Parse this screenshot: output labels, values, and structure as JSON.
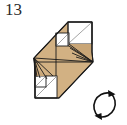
{
  "page": {
    "background": "#ffffff",
    "width": 127,
    "height": 125
  },
  "step": {
    "number": "13",
    "label_color": "#2b2b2b"
  },
  "colors": {
    "paper_front": "#d2b183",
    "paper_front_shade": "#c9a677",
    "paper_back": "#ffffff",
    "crease_line": "#1a1a1a",
    "soft_crease_line": "#8e8e8e",
    "outline": "#1a1a1a",
    "symbol": "#111111"
  },
  "figure": {
    "name": "origami-fold-step-diagram",
    "outline_points": "34,58 68,22 92,22 92,52 93,62 59,98 35,98 35,68",
    "parts": [
      {
        "name": "main-body-panel",
        "fill": "paper_front"
      },
      {
        "name": "upper-white-square-large",
        "fill": "paper_back"
      },
      {
        "name": "upper-white-square-small",
        "fill": "paper_back"
      },
      {
        "name": "lower-white-square-large",
        "fill": "paper_back"
      },
      {
        "name": "lower-white-square-small",
        "fill": "paper_back"
      },
      {
        "name": "right-fan-pleats",
        "fill": "paper_front_shade"
      },
      {
        "name": "left-fan-pleats",
        "fill": "paper_front_shade"
      }
    ]
  },
  "rotation_symbol": {
    "name": "rotate-arrows-icon",
    "description": "circle with two opposing arrowheads indicating turn over / rotate",
    "direction": "clockwise",
    "arrow_count": 2,
    "cx": 19,
    "cy": 19,
    "r": 13.5
  }
}
